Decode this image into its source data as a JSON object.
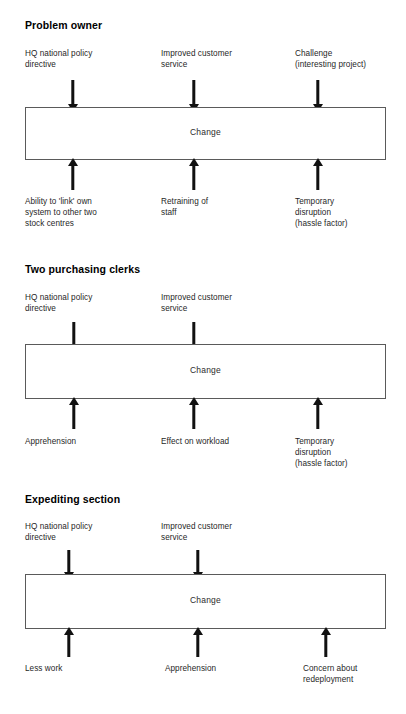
{
  "diagram": {
    "type": "force-field-analysis",
    "box_label": "Change",
    "sections": [
      {
        "id": "problem-owner",
        "heading": "Problem owner",
        "driving_forces": [
          "HQ national policy directive",
          "Improved customer service",
          "Challenge (interesting project)"
        ],
        "driving_forces_lines": [
          "HQ national policy\ndirective",
          "Improved customer\nservice",
          "Challenge\n(interesting project)"
        ],
        "restraining_forces": [
          "Ability to 'link' own system to other two stock centres",
          "Retraining of staff",
          "Temporary disruption (hassle factor)"
        ],
        "restraining_forces_lines": [
          "Ability to 'link' own\nsystem to other two\nstock centres",
          "Retraining of\nstaff",
          "Temporary\ndisruption\n(hassle factor)"
        ]
      },
      {
        "id": "two-purchasing-clerks",
        "heading": "Two purchasing clerks",
        "driving_forces": [
          "HQ national policy directive",
          "Improved customer service"
        ],
        "driving_forces_lines": [
          "HQ national policy\ndirective",
          "Improved customer\nservice"
        ],
        "restraining_forces": [
          "Apprehension",
          "Effect on workload",
          "Temporary disruption (hassle factor)"
        ],
        "restraining_forces_lines": [
          "Apprehension",
          "Effect on workload",
          "Temporary\ndisruption\n(hassle factor)"
        ]
      },
      {
        "id": "expediting-section",
        "heading": "Expediting section",
        "driving_forces": [
          "HQ national policy directive",
          "Improved customer service"
        ],
        "driving_forces_lines": [
          "HQ national policy\ndirective",
          "Improved customer\nservice"
        ],
        "restraining_forces": [
          "Less work",
          "Apprehension",
          "Concern about redeployment"
        ],
        "restraining_forces_lines": [
          "Less work",
          "Apprehension",
          "Concern about\nredeployment"
        ]
      }
    ],
    "colors": {
      "box_border": "#5a5a5a",
      "arrow": "#111111",
      "text": "#1f1f1f",
      "background": "#ffffff"
    }
  }
}
